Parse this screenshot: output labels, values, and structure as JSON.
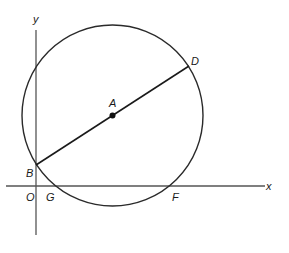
{
  "diagram": {
    "type": "coordinate-geometry",
    "axes": {
      "x_label": "x",
      "y_label": "y",
      "origin_label": "O"
    },
    "circle": {
      "center_label": "A"
    },
    "points": [
      {
        "label": "A",
        "role": "center"
      },
      {
        "label": "B",
        "role": "circle meets y-axis; endpoint of diameter"
      },
      {
        "label": "D",
        "role": "endpoint of diameter"
      },
      {
        "label": "G",
        "role": "circle meets x-axis"
      },
      {
        "label": "F",
        "role": "circle meets x-axis"
      },
      {
        "label": "O",
        "role": "origin"
      }
    ],
    "segments": [
      {
        "from": "B",
        "to": "D",
        "through": "A"
      }
    ],
    "colors": {
      "ink": "#1a1a1a",
      "axis": "#555555",
      "background": "#ffffff"
    }
  }
}
